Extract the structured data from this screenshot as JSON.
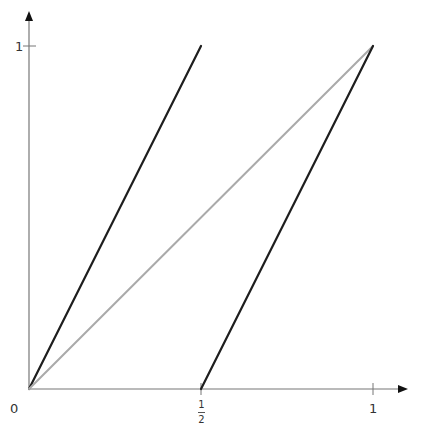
{
  "chart_data": {
    "type": "line",
    "title": "",
    "xlabel": "",
    "ylabel": "",
    "xlim": [
      0,
      1
    ],
    "ylim": [
      0,
      1
    ],
    "grid": false,
    "legend": null,
    "x_ticks": [
      {
        "value": 0.5,
        "label_num": "1",
        "label_den": "2"
      },
      {
        "value": 1,
        "label": "1"
      }
    ],
    "y_ticks": [
      {
        "value": 1,
        "label": "1"
      }
    ],
    "origin_label": "0",
    "series": [
      {
        "name": "doubling-map-left-branch",
        "color": "#1e1e1e",
        "x": [
          0,
          0.5
        ],
        "y": [
          0,
          1
        ]
      },
      {
        "name": "identity-line",
        "color": "#aaaaaa",
        "x": [
          0,
          1
        ],
        "y": [
          0,
          1
        ]
      },
      {
        "name": "doubling-map-right-branch",
        "color": "#1e1e1e",
        "x": [
          0.5,
          1
        ],
        "y": [
          0,
          1
        ]
      }
    ]
  },
  "labels": {
    "origin": "0",
    "x_half_num": "1",
    "x_half_den": "2",
    "x_one": "1",
    "y_one": "1"
  },
  "colors": {
    "axis": "#777777",
    "branch": "#1e1e1e",
    "diagonal": "#aaaaaa"
  }
}
